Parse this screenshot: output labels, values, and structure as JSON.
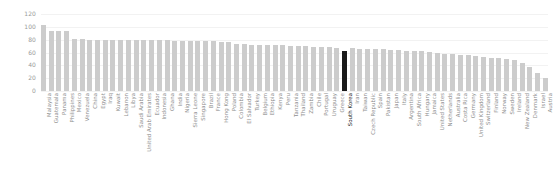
{
  "chart_data": {
    "type": "bar",
    "title": "",
    "subtitle": "",
    "xlabel": "",
    "ylabel": "",
    "ylim": [
      0,
      120
    ],
    "yticks": [
      0,
      20,
      40,
      60,
      80,
      100,
      120
    ],
    "ytick_labels": [
      "0",
      "20",
      "40",
      "60",
      "80",
      "100",
      "120"
    ],
    "grid": true,
    "legend": "none",
    "bar_color": "#cccccc",
    "highlight_color": "#1a1a1a",
    "highlight_category": "South Korea",
    "categories": [
      "Malaysia",
      "Guatemala",
      "Panama",
      "Philippines",
      "Mexico",
      "Venezuela",
      "China",
      "Egypt",
      "Iraq",
      "Kuwait",
      "Lebanon",
      "Libya",
      "Saudi Arabia",
      "United Arab Emirates",
      "Ecuador",
      "Indonesia",
      "Ghana",
      "India",
      "Nigeria",
      "Sierra Leone",
      "Singapore",
      "Brazil",
      "France",
      "Hong Kong",
      "Poland",
      "Colombia",
      "El Salvador",
      "Turkey",
      "Belgium",
      "Ethiopia",
      "Kenya",
      "Peru",
      "Tanzania",
      "Thailand",
      "Zambia",
      "Chile",
      "Portugal",
      "Uruguay",
      "Greece",
      "South Korea",
      "Iran",
      "Taiwan",
      "Czech Republic",
      "Spain",
      "Pakistan",
      "Japan",
      "Italy",
      "Argentina",
      "South Africa",
      "Hungary",
      "Jamaica",
      "United States",
      "Netherlands",
      "Australia",
      "Costa Rica",
      "Germany",
      "United Kingdom",
      "Switzerland",
      "Finland",
      "Norway",
      "Sweden",
      "Ireland",
      "New Zealand",
      "Denmark",
      "Israel",
      "Austria"
    ],
    "values": [
      103,
      93,
      93,
      93,
      81,
      81,
      80,
      80,
      80,
      80,
      80,
      80,
      80,
      80,
      79,
      79,
      79,
      78,
      78,
      78,
      78,
      78,
      78,
      77,
      77,
      73,
      73,
      72,
      72,
      72,
      71,
      71,
      70,
      70,
      70,
      69,
      68,
      68,
      67,
      62,
      67,
      66,
      66,
      65,
      65,
      64,
      64,
      63,
      63,
      62,
      61,
      60,
      58,
      57,
      56,
      56,
      54,
      53,
      52,
      51,
      50,
      48,
      44,
      38,
      28,
      20
    ]
  }
}
